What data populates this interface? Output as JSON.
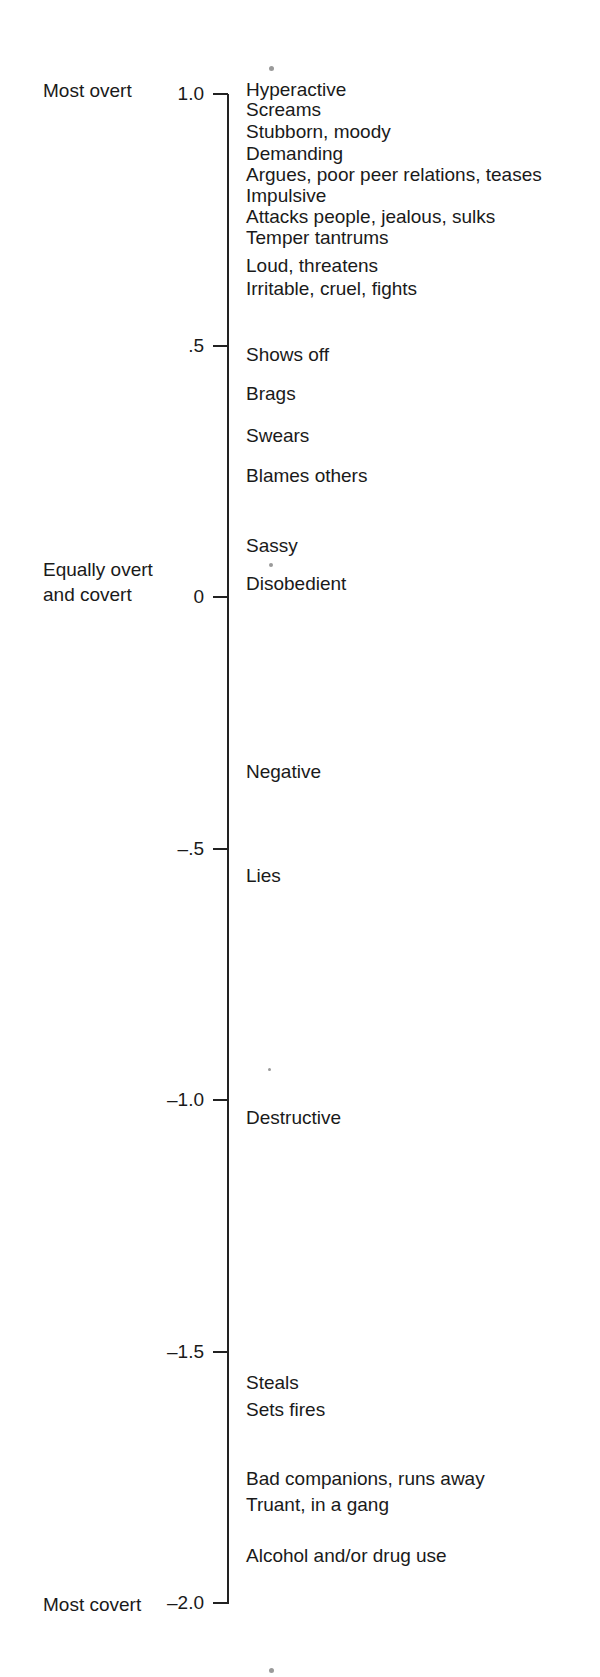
{
  "chart_data": {
    "type": "scale",
    "title": "",
    "axis": {
      "orientation": "vertical",
      "range": [
        -2.0,
        1.0
      ],
      "ticks": [
        {
          "value": 1.0,
          "label": "1.0",
          "y": 94
        },
        {
          "value": 0.5,
          "label": ".5",
          "y": 346
        },
        {
          "value": 0.0,
          "label": "0",
          "y": 597
        },
        {
          "value": -0.5,
          "label": "–.5",
          "y": 849
        },
        {
          "value": -1.0,
          "label": "–1.0",
          "y": 1100
        },
        {
          "value": -1.5,
          "label": "–1.5",
          "y": 1352
        },
        {
          "value": -2.0,
          "label": "–2.0",
          "y": 1603
        }
      ],
      "anchor_labels": [
        {
          "text": "Most overt",
          "value": 1.0,
          "y": 91
        },
        {
          "text": "Equally overt",
          "value": 0.0,
          "y": 570
        },
        {
          "text": "and covert",
          "value": 0.0,
          "y": 595
        },
        {
          "text": "Most covert",
          "value": -2.0,
          "y": 1605
        }
      ]
    },
    "items": [
      {
        "label": "Hyperactive",
        "value": 1.0,
        "y": 90
      },
      {
        "label": "Screams",
        "value": 0.96,
        "y": 110
      },
      {
        "label": "Stubborn, moody",
        "value": 0.91,
        "y": 132
      },
      {
        "label": "Demanding",
        "value": 0.87,
        "y": 154
      },
      {
        "label": "Argues, poor peer relations, teases",
        "value": 0.83,
        "y": 175
      },
      {
        "label": "Impulsive",
        "value": 0.79,
        "y": 196
      },
      {
        "label": "Attacks people, jealous, sulks",
        "value": 0.75,
        "y": 217
      },
      {
        "label": "Temper tantrums",
        "value": 0.71,
        "y": 238
      },
      {
        "label": "Loud, threatens",
        "value": 0.66,
        "y": 266
      },
      {
        "label": "Irritable, cruel, fights",
        "value": 0.61,
        "y": 289
      },
      {
        "label": "Shows off",
        "value": 0.45,
        "y": 355
      },
      {
        "label": "Brags",
        "value": 0.38,
        "y": 394
      },
      {
        "label": "Swears",
        "value": 0.32,
        "y": 436
      },
      {
        "label": "Blames others",
        "value": 0.24,
        "y": 476
      },
      {
        "label": "Sassy",
        "value": 0.1,
        "y": 546
      },
      {
        "label": "Disobedient",
        "value": 0.03,
        "y": 584
      },
      {
        "label": "Negative",
        "value": -0.35,
        "y": 772
      },
      {
        "label": "Lies",
        "value": -0.55,
        "y": 876
      },
      {
        "label": "Destructive",
        "value": -1.03,
        "y": 1118
      },
      {
        "label": "Steals",
        "value": -1.57,
        "y": 1383
      },
      {
        "label": "Sets fires",
        "value": -1.62,
        "y": 1410
      },
      {
        "label": "Bad companions, runs away",
        "value": -1.75,
        "y": 1479
      },
      {
        "label": "Truant, in a gang",
        "value": -1.8,
        "y": 1505
      },
      {
        "label": "Alcohol and/or drug use",
        "value": -1.9,
        "y": 1556
      }
    ],
    "xlabel": "",
    "ylabel": "",
    "grid": false,
    "legend": null
  }
}
